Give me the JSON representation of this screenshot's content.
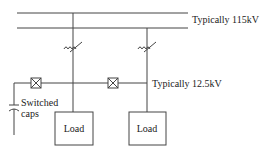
{
  "diagram": {
    "title": "",
    "high_voltage_bus": {
      "label": "Typically 115kV"
    },
    "low_voltage_bus": {
      "label": "Typically 12.5kV"
    },
    "capacitor": {
      "label_line1": "Switched",
      "label_line2": "caps"
    },
    "loads": [
      {
        "label": "Load"
      },
      {
        "label": "Load"
      }
    ],
    "symbols": {
      "transformer": "transformer-icon",
      "breaker": "breaker-icon",
      "capacitor": "capacitor-icon"
    },
    "colors": {
      "line": "#444444",
      "text": "#222222",
      "background": "#ffffff"
    }
  }
}
